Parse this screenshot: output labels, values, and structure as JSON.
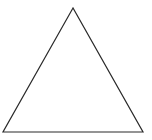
{
  "diagram": {
    "shape": "triangle",
    "kind": "equilateral-outline",
    "stroke_color": "#2a2a2a",
    "fill_color": "#ffffff",
    "stroke_width": 1.2,
    "vertices": {
      "apex": [
        73,
        8
      ],
      "bottom_left": [
        3,
        132
      ],
      "bottom_right": [
        143,
        132
      ]
    }
  }
}
